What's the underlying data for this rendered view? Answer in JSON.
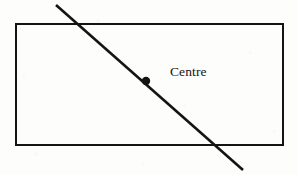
{
  "figure": {
    "kind": "geometric-diagram",
    "background_color": "#fdfdfb",
    "ink_color": "#141414",
    "canvas": {
      "width": 298,
      "height": 175
    }
  },
  "labels": {
    "centre": "Centre"
  },
  "shapes": {
    "rectangle": {
      "name": "rectangle",
      "x": 16,
      "y": 24,
      "width": 267,
      "height": 121,
      "stroke_width": 2.2,
      "stroke_color": "#141414",
      "fill": "none"
    },
    "diagonal_line": {
      "name": "diagonal-line",
      "x1": 56,
      "y1": 5,
      "x2": 243,
      "y2": 170,
      "stroke_width": 2.6,
      "stroke_color": "#141414"
    },
    "centre_point": {
      "name": "centre-point",
      "cx": 146,
      "cy": 81,
      "r": 4.2,
      "fill": "#141414"
    }
  }
}
